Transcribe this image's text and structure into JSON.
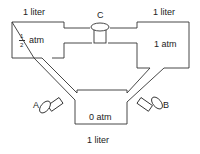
{
  "diagram": {
    "containers": {
      "left": {
        "volume": "1 liter",
        "pressure_num": "1",
        "pressure_den": "2",
        "pressure_unit": "atm"
      },
      "right": {
        "volume": "1 liter",
        "pressure": "1 atm"
      },
      "bottom": {
        "volume": "1 liter",
        "pressure": "0 atm"
      }
    },
    "valves": {
      "a": "A",
      "b": "B",
      "c": "C"
    },
    "colors": {
      "stroke": "#333333",
      "background": "#ffffff"
    }
  }
}
